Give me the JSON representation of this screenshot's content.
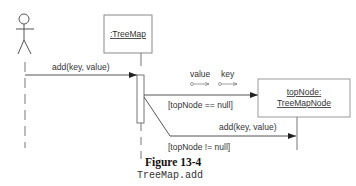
{
  "diagram": {
    "type": "sequence",
    "actor": {
      "name": ""
    },
    "objects": [
      {
        "id": "treemap",
        "label": ":TreeMap"
      },
      {
        "id": "topnode",
        "label_line1": "topNode:",
        "label_line2": "TreeMapNode"
      }
    ],
    "messages": [
      {
        "from": "actor",
        "to": "treemap",
        "label": "add(key, value)"
      },
      {
        "from": "treemap",
        "to": "topnode",
        "label": "",
        "guard": "[topNode == null]",
        "kind": "create"
      },
      {
        "from": "treemap",
        "to": "topnode",
        "label": "add(key, value)",
        "guard": "[topNode != null]"
      }
    ],
    "parameters": [
      {
        "label": "value"
      },
      {
        "label": "key"
      }
    ]
  },
  "caption": {
    "title": "Figure 13-4",
    "subtitle": "TreeMap.add"
  },
  "colors": {
    "line": "#555555",
    "box_border": "#888888",
    "text": "#333333"
  }
}
